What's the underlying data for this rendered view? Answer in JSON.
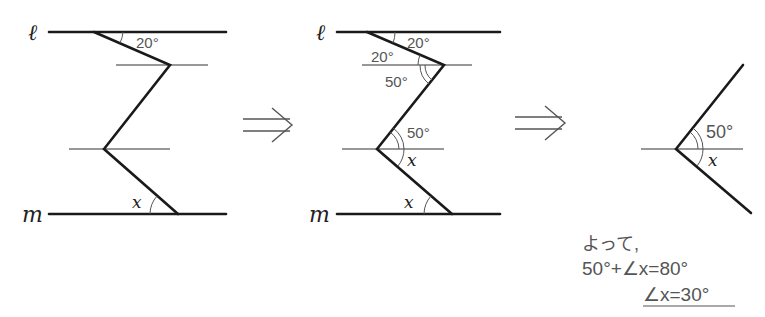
{
  "figures": [
    {
      "id": "original",
      "line_labels": {
        "top": "ℓ",
        "bottom": "m"
      },
      "angles": [
        {
          "label": "20°"
        },
        {
          "label": "x"
        }
      ]
    },
    {
      "id": "auxiliary",
      "line_labels": {
        "top": "ℓ",
        "bottom": "m"
      },
      "angles": [
        {
          "label": "20°"
        },
        {
          "label": "20°"
        },
        {
          "label": "50°"
        },
        {
          "label": "50°"
        },
        {
          "label": "x"
        },
        {
          "label": "x"
        }
      ]
    },
    {
      "id": "extracted",
      "angles": [
        {
          "label": "50°"
        },
        {
          "label": "x"
        }
      ]
    }
  ],
  "arrows": [
    "⇒",
    "⇒"
  ],
  "solution": {
    "line1": "よって,",
    "line2": "50°+∠x=80°",
    "line3": "∠x=30°"
  }
}
